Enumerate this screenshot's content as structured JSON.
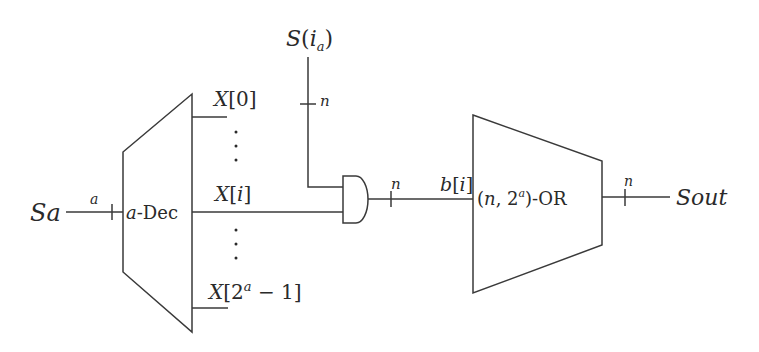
{
  "diagram": {
    "input": {
      "label": "Sa",
      "bus_width": "a"
    },
    "decoder": {
      "label": "a-Dec",
      "outputs": [
        {
          "label": "X[0]"
        },
        {
          "label": "X[i]"
        },
        {
          "label": "X[2^a − 1]"
        }
      ]
    },
    "select_signal": {
      "label": "S(i_a)",
      "bus_width": "n"
    },
    "and_gate": {
      "output_width": "n",
      "output_label": "b[i]"
    },
    "or_block": {
      "label": "(n, 2^a)-OR"
    },
    "output": {
      "label": "Sout",
      "bus_width": "n"
    }
  },
  "text": {
    "sa": "Sa",
    "a_width": "a",
    "dec_a": "a",
    "dec_rest": "-Dec",
    "x0_X": "X",
    "x0_idx": "[0]",
    "xi_X": "X",
    "xi_open": "[",
    "xi_i": "i",
    "xi_close": "]",
    "xl_X": "X",
    "xl_open": "[2",
    "xl_sup": "a",
    "xl_rest": " − 1]",
    "s_S": "S",
    "s_open": "(",
    "s_i": "i",
    "s_sub": "a",
    "s_close": ")",
    "s_n": "n",
    "and_n": "n",
    "b_b": "b",
    "b_open": "[",
    "b_i": "i",
    "b_close": "]",
    "or_open": "(",
    "or_n": "n",
    "or_comma": ", 2",
    "or_sup": "a",
    "or_rest": ")-OR",
    "out_n": "n",
    "sout": "Sout"
  }
}
